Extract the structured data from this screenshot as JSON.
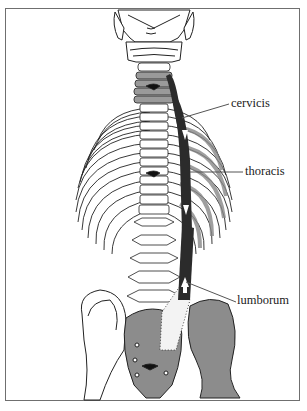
{
  "figure": {
    "labels": [
      {
        "id": "cervicis",
        "text": "cervicis",
        "x": 231,
        "y": 97
      },
      {
        "id": "thoracis",
        "text": "thoracis",
        "x": 245,
        "y": 165
      },
      {
        "id": "lumborum",
        "text": "lumborum",
        "x": 237,
        "y": 294
      }
    ],
    "colors": {
      "frame": "#6f6f6f",
      "bone_outline": "#222222",
      "bone_fill": "#ffffff",
      "shaded_bone": "#9a9a9a",
      "muscle": "#2b2b2b",
      "leader_line": "#555555"
    }
  }
}
